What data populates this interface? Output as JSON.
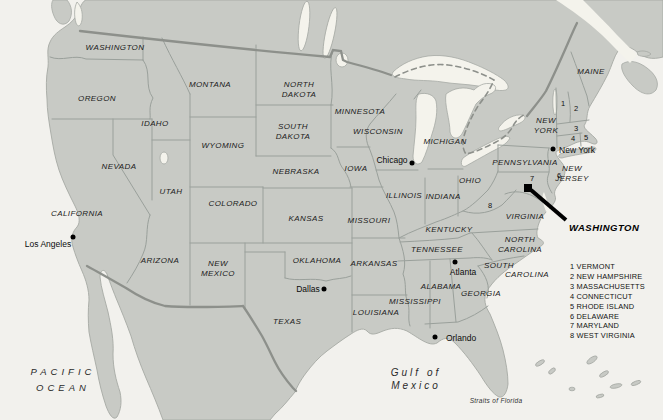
{
  "map": {
    "title": "United States reference map",
    "colors": {
      "ocean": "#f2f1ed",
      "land": "#c8cac5",
      "water": "#f4f3ec",
      "state_border": "#9aa09b",
      "national_border": "#8d908b",
      "label_text": "#1b1b1b",
      "marker": "#000000"
    },
    "state_labels": [
      {
        "id": "washington-state",
        "text": "WASHINGTON",
        "x": 115,
        "y": 48
      },
      {
        "id": "oregon",
        "text": "OREGON",
        "x": 97,
        "y": 99
      },
      {
        "id": "idaho",
        "text": "IDAHO",
        "x": 155,
        "y": 124
      },
      {
        "id": "montana",
        "text": "MONTANA",
        "x": 210,
        "y": 85
      },
      {
        "id": "north-dakota",
        "text": "NORTH\nDAKOTA",
        "x": 299,
        "y": 89
      },
      {
        "id": "south-dakota",
        "text": "SOUTH\nDAKOTA",
        "x": 293,
        "y": 131
      },
      {
        "id": "wyoming",
        "text": "WYOMING",
        "x": 223,
        "y": 146
      },
      {
        "id": "nevada",
        "text": "NEVADA",
        "x": 119,
        "y": 167
      },
      {
        "id": "utah",
        "text": "UTAH",
        "x": 171,
        "y": 192
      },
      {
        "id": "colorado",
        "text": "COLORADO",
        "x": 233,
        "y": 204
      },
      {
        "id": "nebraska",
        "text": "NEBRASKA",
        "x": 296,
        "y": 172
      },
      {
        "id": "kansas",
        "text": "KANSAS",
        "x": 306,
        "y": 219
      },
      {
        "id": "minnesota",
        "text": "MINNESOTA",
        "x": 360,
        "y": 112
      },
      {
        "id": "wisconsin",
        "text": "WISCONSIN",
        "x": 378,
        "y": 132
      },
      {
        "id": "iowa",
        "text": "IOWA",
        "x": 356,
        "y": 169
      },
      {
        "id": "missouri",
        "text": "MISSOURI",
        "x": 369,
        "y": 221
      },
      {
        "id": "michigan",
        "text": "MICHIGAN",
        "x": 445,
        "y": 142
      },
      {
        "id": "illinois",
        "text": "ILLINOIS",
        "x": 404,
        "y": 196
      },
      {
        "id": "indiana",
        "text": "INDIANA",
        "x": 443,
        "y": 197
      },
      {
        "id": "ohio",
        "text": "OHIO",
        "x": 470,
        "y": 181
      },
      {
        "id": "california",
        "text": "CALIFORNIA",
        "x": 77,
        "y": 214
      },
      {
        "id": "arizona",
        "text": "ARIZONA",
        "x": 160,
        "y": 261
      },
      {
        "id": "new-mexico",
        "text": "NEW\nMEXICO",
        "x": 218,
        "y": 268
      },
      {
        "id": "oklahoma",
        "text": "OKLAHOMA",
        "x": 317,
        "y": 261
      },
      {
        "id": "arkansas",
        "text": "ARKANSAS",
        "x": 374,
        "y": 264
      },
      {
        "id": "kentucky",
        "text": "KENTUCKY",
        "x": 449,
        "y": 230
      },
      {
        "id": "tennessee",
        "text": "TENNESSEE",
        "x": 437,
        "y": 250
      },
      {
        "id": "texas",
        "text": "TEXAS",
        "x": 287,
        "y": 322
      },
      {
        "id": "louisiana",
        "text": "LOUISIANA",
        "x": 376,
        "y": 313
      },
      {
        "id": "mississippi",
        "text": "MISSISSIPPI",
        "x": 415,
        "y": 302
      },
      {
        "id": "alabama",
        "text": "ALABAMA",
        "x": 441,
        "y": 287
      },
      {
        "id": "georgia",
        "text": "GEORGIA",
        "x": 481,
        "y": 294
      },
      {
        "id": "virginia",
        "text": "VIRGINIA",
        "x": 525,
        "y": 217
      },
      {
        "id": "north-carolina",
        "text": "NORTH\nCAROLINA",
        "x": 520,
        "y": 244
      },
      {
        "id": "south-carolina-1",
        "text": "SOUTH",
        "x": 499,
        "y": 266
      },
      {
        "id": "south-carolina-2",
        "text": "CAROLINA",
        "x": 527,
        "y": 275
      },
      {
        "id": "pennsylvania",
        "text": "PENNSYLVANIA",
        "x": 525,
        "y": 163
      },
      {
        "id": "new-york-state",
        "text": "NEW\nYORK",
        "x": 546,
        "y": 125
      },
      {
        "id": "new-jersey",
        "text": "NEW\nJERSEY",
        "x": 572,
        "y": 173
      },
      {
        "id": "maine",
        "text": "MAINE",
        "x": 591,
        "y": 72
      }
    ],
    "numbered_states": [
      {
        "n": "1",
        "x": 563,
        "y": 103
      },
      {
        "n": "2",
        "x": 576,
        "y": 108
      },
      {
        "n": "3",
        "x": 576,
        "y": 128
      },
      {
        "n": "4",
        "x": 573,
        "y": 138
      },
      {
        "n": "5",
        "x": 586,
        "y": 137
      },
      {
        "n": "6",
        "x": 559,
        "y": 175
      },
      {
        "n": "7",
        "x": 532,
        "y": 178
      },
      {
        "n": "8",
        "x": 490,
        "y": 205
      }
    ],
    "cities": [
      {
        "id": "los-angeles",
        "label": "Los Angeles",
        "lx": 48,
        "ly": 244,
        "dx": 73,
        "dy": 237
      },
      {
        "id": "chicago",
        "label": "Chicago",
        "lx": 392,
        "ly": 160,
        "dx": 412,
        "dy": 163
      },
      {
        "id": "new-york-city",
        "label": "New York",
        "lx": 577,
        "ly": 150,
        "dx": 553,
        "dy": 149
      },
      {
        "id": "dallas",
        "label": "Dallas",
        "lx": 308,
        "ly": 289,
        "dx": 324,
        "dy": 289
      },
      {
        "id": "atlanta",
        "label": "Atlanta",
        "lx": 463,
        "ly": 272,
        "dx": 455,
        "dy": 262
      },
      {
        "id": "orlando",
        "label": "Orlando",
        "lx": 461,
        "ly": 338,
        "dx": 435,
        "dy": 337
      }
    ],
    "capital": {
      "label": "WASHINGTON",
      "label_x": 569,
      "label_y": 227,
      "square_x": 528,
      "square_y": 188
    },
    "ocean_labels": {
      "pacific": {
        "text": "PACIFIC\nOCEAN",
        "x": 63,
        "y": 379
      },
      "gulf": {
        "text": "Gulf of\nMexico",
        "x": 416,
        "y": 379
      },
      "straits": {
        "text": "Straits of Florida",
        "x": 496,
        "y": 400
      }
    },
    "legend": {
      "items": [
        "1 VERMONT",
        "2 NEW HAMPSHIRE",
        "3 MASSACHUSETTS",
        "4 CONNECTICUT",
        "5 RHODE ISLAND",
        "6 DELAWARE",
        "7 MARYLAND",
        "8 WEST VIRGINIA"
      ]
    }
  }
}
